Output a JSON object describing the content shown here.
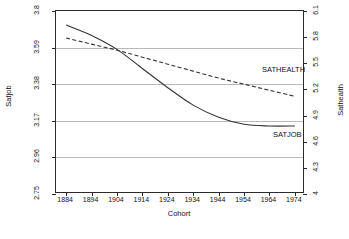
{
  "chart_data": {
    "type": "line",
    "title": "",
    "xlabel": "Cohort",
    "ylabel": "Satjob",
    "y2label": "Sathealth",
    "grid": true,
    "legend_position": "inline-right",
    "xlim": [
      1880,
      1978
    ],
    "ylim": [
      2.75,
      3.8
    ],
    "y2lim": [
      4.0,
      6.1
    ],
    "xticks": [
      1884,
      1894,
      1904,
      1914,
      1924,
      1934,
      1944,
      1954,
      1964,
      1974
    ],
    "yticks": [
      3.8,
      3.59,
      3.38,
      3.17,
      2.96,
      2.75
    ],
    "y2ticks": [
      6.1,
      5.8,
      5.5,
      5.2,
      4.9,
      4.6,
      4.3,
      4
    ],
    "series": [
      {
        "name": "SATJOB",
        "axis": "left",
        "style": "solid",
        "color": "#333333",
        "x": [
          1884,
          1894,
          1904,
          1914,
          1924,
          1934,
          1944,
          1954,
          1964,
          1974
        ],
        "values": [
          3.72,
          3.66,
          3.58,
          3.47,
          3.36,
          3.26,
          3.19,
          3.15,
          3.14,
          3.14
        ]
      },
      {
        "name": "SATHEALTH",
        "axis": "right",
        "style": "dashed",
        "color": "#333333",
        "x": [
          1884,
          1894,
          1904,
          1914,
          1924,
          1934,
          1944,
          1954,
          1964,
          1974
        ],
        "values": [
          5.79,
          5.72,
          5.65,
          5.57,
          5.49,
          5.41,
          5.33,
          5.26,
          5.19,
          5.12
        ]
      }
    ],
    "annotations": [
      {
        "text": "SATHEALTH",
        "x": 262,
        "y": 68
      },
      {
        "text": "SATJOB",
        "x": 273,
        "y": 133
      }
    ]
  },
  "axes": {
    "left": {
      "title": "Satjob",
      "ticks": [
        "3.8",
        "3.59",
        "3.38",
        "3.17",
        "2.96",
        "2.75"
      ]
    },
    "right": {
      "title": "Sathealth",
      "ticks": [
        "6.1",
        "5.8",
        "5.5",
        "5.2",
        "4.9",
        "4.6",
        "4.3",
        "4"
      ]
    },
    "bottom": {
      "title": "Cohort",
      "ticks": [
        "1884",
        "1894",
        "1904",
        "1914",
        "1924",
        "1934",
        "1944",
        "1954",
        "1964",
        "1974"
      ]
    }
  },
  "series_labels": {
    "sathealth": "SATHEALTH",
    "satjob": "SATJOB"
  }
}
